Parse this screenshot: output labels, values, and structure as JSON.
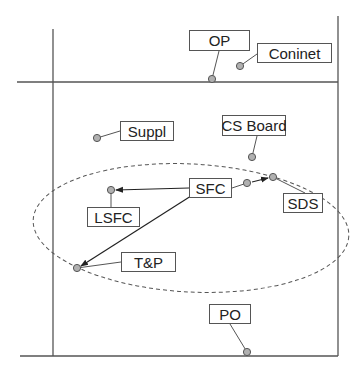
{
  "diagram": {
    "colors": {
      "line": "#555555",
      "dot_fill": "#b0b0b0",
      "dot_stroke": "#555555",
      "ellipse": "#555555"
    },
    "frame": {
      "left_x": 53,
      "right_x": 338,
      "top_line_y": 82,
      "bottom_line_y": 356,
      "left_top": 29,
      "right_top": 16,
      "h_start": 17
    },
    "ellipse": {
      "cx": 191,
      "cy": 228,
      "rx": 158,
      "ry": 64,
      "rotate": 3
    },
    "nodes": [
      {
        "id": "op",
        "label": "OP",
        "x": 189,
        "y": 30,
        "w": 61,
        "h": 21,
        "dot": [
          212,
          79
        ],
        "anchor": [
          219,
          51
        ]
      },
      {
        "id": "coninet",
        "label": "Coninet",
        "x": 257,
        "y": 43,
        "w": 75,
        "h": 20,
        "dot": [
          240,
          66
        ],
        "anchor": [
          257,
          54
        ]
      },
      {
        "id": "suppl",
        "label": "Suppl",
        "x": 120,
        "y": 121,
        "w": 54,
        "h": 20,
        "dot": [
          97,
          138
        ],
        "anchor": [
          120,
          131
        ]
      },
      {
        "id": "cs-board",
        "label": "CS Board",
        "x": 222,
        "y": 115,
        "w": 64,
        "h": 21,
        "dot": [
          252,
          157
        ],
        "anchor": [
          257,
          136
        ]
      },
      {
        "id": "sfc",
        "label": "SFC",
        "x": 189,
        "y": 178,
        "w": 43,
        "h": 20,
        "dot": [
          247,
          183
        ],
        "anchor": [
          232,
          188
        ]
      },
      {
        "id": "sds",
        "label": "SDS",
        "x": 283,
        "y": 193,
        "w": 40,
        "h": 20,
        "dot": [
          273,
          177
        ],
        "anchor": [
          305,
          193
        ]
      },
      {
        "id": "lsfc",
        "label": "LSFC",
        "x": 87,
        "y": 207,
        "w": 53,
        "h": 20,
        "dot": [
          111,
          190
        ],
        "anchor": [
          111,
          207
        ]
      },
      {
        "id": "tp",
        "label": "T&P",
        "x": 121,
        "y": 252,
        "w": 55,
        "h": 20,
        "dot": [
          77,
          268
        ],
        "anchor": [
          121,
          262
        ]
      },
      {
        "id": "po",
        "label": "PO",
        "x": 209,
        "y": 304,
        "w": 42,
        "h": 20,
        "dot": [
          247,
          352
        ],
        "anchor": [
          230,
          324
        ]
      }
    ],
    "arrows": [
      {
        "from": "SFC",
        "to": "SDS",
        "x1": 252,
        "y1": 182,
        "x2": 268,
        "y2": 178
      },
      {
        "from": "SFC",
        "to": "LSFC",
        "x1": 189,
        "y1": 188,
        "x2": 116,
        "y2": 190
      },
      {
        "from": "SFC",
        "to": "T&P",
        "x1": 191,
        "y1": 196,
        "x2": 81,
        "y2": 266
      }
    ]
  }
}
